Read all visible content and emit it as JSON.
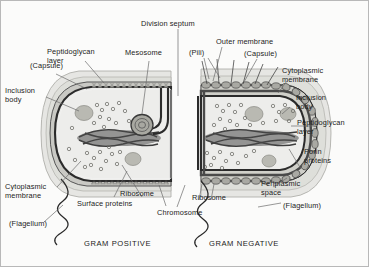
{
  "figure": {
    "background_color": "#fbfbfa",
    "border_color": "#b8b8b8",
    "text_color": "#1b1b1b"
  },
  "captions": {
    "gram_positive": "GRAM POSITIVE",
    "gram_negative": "GRAM NEGATIVE"
  },
  "labels": {
    "capsule_left": "(Capsule)",
    "peptidoglycan_layer_left": "Peptidoglycan\nlayer",
    "inclusion_body_left": "Inclusion\nbody",
    "mesosome": "Mesosome",
    "division_septum": "Division septum",
    "outer_membrane": "Outer membrane",
    "pili": "(Pili)",
    "capsule_right": "(Capsule)",
    "cytoplasmic_membrane_right": "Cytoplasmic\nmembrane",
    "inclusion_body_right": "Inclusion\nbody",
    "peptidoglycan_layer_right": "Peptidoglycan\nlayer",
    "porin_proteins": "Porin\nproteins",
    "periplasmic_space": "Periplasmic\nspace",
    "flagellum_right": "(Flagellum)",
    "cytoplasmic_membrane_left": "Cytoplasmic\nmembrane",
    "surface_proteins": "Surface proteins",
    "ribosome_left": "Ribosome",
    "chromosome": "Chromosome",
    "ribosome_right": "Ribosome",
    "flagellum_left": "(Flagellum)"
  },
  "colors": {
    "capsule_fill": "#e3e3e0",
    "capsule_stroke": "#9a9a96",
    "peptidoglycan_fill": "#c9c9c4",
    "cytoplasm_fill": "#ececea",
    "membrane_stroke": "#2e2e2e",
    "chromosome_fill": "#4a4a4a",
    "inclusion_fill": "#b5b5ae",
    "ribosome_stroke": "#6f6f6b",
    "leader_stroke": "#6b6b6b"
  },
  "structures": {
    "cells": [
      {
        "name": "gram-positive-cell",
        "type": "dividing rod",
        "envelope": "thick smooth peptidoglycan layer with capsule"
      },
      {
        "name": "gram-negative-cell",
        "type": "dividing rod",
        "envelope": "beaded outer membrane with porins, thin peptidoglycan, periplasmic space"
      }
    ],
    "shared": [
      "chromosome",
      "ribosomes",
      "inclusion body",
      "cytoplasmic membrane",
      "division septum",
      "flagellum",
      "capsule"
    ]
  }
}
